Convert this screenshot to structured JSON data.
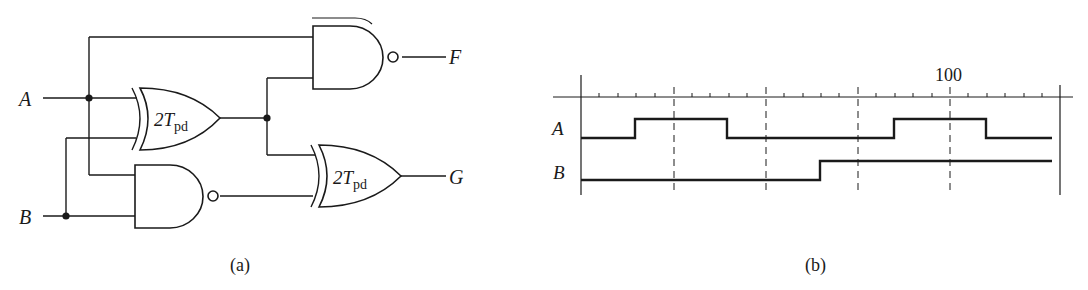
{
  "figure": {
    "part_a": {
      "caption": "(a)",
      "inputs": [
        "A",
        "B"
      ],
      "outputs": [
        "F",
        "G"
      ],
      "gates": [
        {
          "id": "xor1",
          "type": "XOR",
          "label_main": "2T",
          "label_sub": "pd",
          "inputs": [
            "A",
            "B"
          ]
        },
        {
          "id": "nand1",
          "type": "NAND",
          "inputs": [
            "A",
            "B"
          ]
        },
        {
          "id": "nand2",
          "type": "NAND",
          "inputs": [
            "A",
            "xor1"
          ],
          "output": "F"
        },
        {
          "id": "xor2",
          "type": "XOR",
          "label_main": "2T",
          "label_sub": "pd",
          "inputs": [
            "xor1",
            "nand1"
          ],
          "output": "G"
        }
      ],
      "labels": {
        "A": "A",
        "B": "B",
        "F": "F",
        "G": "G",
        "xor_main": "2T",
        "xor_sub": "pd"
      }
    },
    "part_b": {
      "caption": "(b)",
      "axis_label": "100",
      "signals": [
        {
          "name": "A",
          "transitions": [
            {
              "t": 20,
              "v": 0
            },
            {
              "t": 32,
              "v": 1
            },
            {
              "t": 52,
              "v": 0
            },
            {
              "t": 88,
              "v": 1
            },
            {
              "t": 108,
              "v": 0
            },
            {
              "t": 124,
              "v": 0
            }
          ]
        },
        {
          "name": "B",
          "transitions": [
            {
              "t": 20,
              "v": 0
            },
            {
              "t": 72,
              "v": 1
            },
            {
              "t": 124,
              "v": 1
            }
          ]
        }
      ],
      "major_ticks": [
        40,
        60,
        80,
        100
      ],
      "minor_tick_step": 4,
      "time_range": [
        20,
        124
      ]
    }
  }
}
